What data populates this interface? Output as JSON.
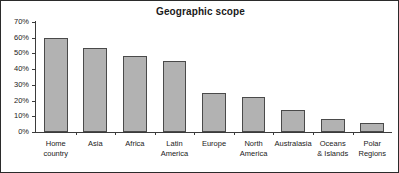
{
  "chart_data": {
    "type": "bar",
    "title": "Geographic scope",
    "xlabel": "",
    "ylabel": "",
    "ylim": [
      0,
      70
    ],
    "grid": false,
    "legend": null,
    "y_tick_labels": [
      "70%",
      "60%",
      "50%",
      "40%",
      "30%",
      "20%",
      "10%",
      "0%"
    ],
    "y_ticks": [
      70,
      60,
      50,
      40,
      30,
      20,
      10,
      0
    ],
    "categories": [
      "Home country",
      "Asia",
      "Africa",
      "Latin America",
      "Europe",
      "North America",
      "Australasia",
      "Oceans & Islands",
      "Polar Regions"
    ],
    "category_lines": [
      [
        "Home",
        "country"
      ],
      [
        "Asia"
      ],
      [
        "Africa"
      ],
      [
        "Latin",
        "America"
      ],
      [
        "Europe"
      ],
      [
        "North",
        "America"
      ],
      [
        "Australasia"
      ],
      [
        "Oceans",
        "& Islands"
      ],
      [
        "Polar",
        "Regions"
      ]
    ],
    "values": [
      60,
      53.5,
      48.5,
      45,
      25,
      22.5,
      14,
      8.5,
      5.5
    ],
    "bar_fill_color": "#b2b2b2",
    "bar_border_color": "#4a4a4a",
    "axis_color": "#3b3b3b",
    "frame_color": "#2b2b2b",
    "text_color": "#1a1a1a",
    "background_color": "#ffffff"
  }
}
